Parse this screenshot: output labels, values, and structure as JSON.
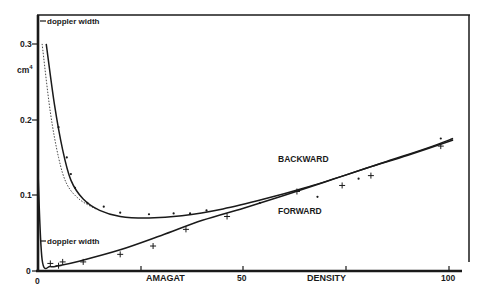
{
  "chart_data": {
    "type": "line",
    "title": "",
    "xlabel": "AMAGAT   DENSITY",
    "ylabel": "cm^4",
    "xlim": [
      0,
      103
    ],
    "ylim": [
      0,
      0.33
    ],
    "grid": false,
    "legend_position": "inline labels",
    "x_ticks": [
      0,
      25,
      50,
      75,
      100
    ],
    "x_tick_labels": [
      "0",
      "",
      "50",
      "",
      "100"
    ],
    "y_ticks": [
      0,
      0.1,
      0.2,
      0.3
    ],
    "y_tick_labels": [
      "0",
      "0.1",
      "0.2",
      "0.3"
    ],
    "annotations": [
      {
        "text": "doppler width",
        "x": 0,
        "y": 0.33,
        "arrow": "left"
      },
      {
        "text": "doppler width",
        "x": 0,
        "y": 0.04,
        "arrow": "left"
      }
    ],
    "series": [
      {
        "name": "BACKWARD",
        "style": "solid curve, dot markers",
        "curve": [
          [
            2,
            0.3
          ],
          [
            4,
            0.22
          ],
          [
            6,
            0.16
          ],
          [
            8,
            0.12
          ],
          [
            11,
            0.095
          ],
          [
            15,
            0.08
          ],
          [
            20,
            0.072
          ],
          [
            27,
            0.07
          ],
          [
            35,
            0.073
          ],
          [
            45,
            0.082
          ],
          [
            55,
            0.095
          ],
          [
            65,
            0.11
          ],
          [
            75,
            0.127
          ],
          [
            85,
            0.145
          ],
          [
            95,
            0.163
          ],
          [
            101,
            0.175
          ]
        ],
        "points": [
          [
            5,
            0.19
          ],
          [
            7,
            0.15
          ],
          [
            8,
            0.128
          ],
          [
            9,
            0.11
          ],
          [
            12,
            0.09
          ],
          [
            16,
            0.085
          ],
          [
            20,
            0.077
          ],
          [
            27,
            0.075
          ],
          [
            33,
            0.076
          ],
          [
            37,
            0.076
          ],
          [
            41,
            0.08
          ],
          [
            54,
            0.09
          ],
          [
            68,
            0.098
          ],
          [
            78,
            0.122
          ],
          [
            98,
            0.175
          ]
        ]
      },
      {
        "name": "BACKWARD (lower envelope)",
        "style": "thin dotted curve",
        "curve": [
          [
            1,
            0.3
          ],
          [
            3,
            0.21
          ],
          [
            5,
            0.15
          ],
          [
            7,
            0.115
          ],
          [
            10,
            0.095
          ],
          [
            14,
            0.082
          ]
        ]
      },
      {
        "name": "FORWARD",
        "style": "solid curve, cross markers",
        "curve": [
          [
            0,
            0.13
          ],
          [
            1,
            0.015
          ],
          [
            3,
            0.006
          ],
          [
            5,
            0.007
          ],
          [
            10,
            0.013
          ],
          [
            20,
            0.028
          ],
          [
            30,
            0.047
          ],
          [
            40,
            0.067
          ],
          [
            50,
            0.083
          ],
          [
            60,
            0.1
          ],
          [
            70,
            0.118
          ],
          [
            80,
            0.136
          ],
          [
            90,
            0.153
          ],
          [
            101,
            0.173
          ]
        ],
        "points": [
          [
            3,
            0.01
          ],
          [
            5,
            0.007
          ],
          [
            6,
            0.012
          ],
          [
            11,
            0.012
          ],
          [
            20,
            0.022
          ],
          [
            28,
            0.033
          ],
          [
            36,
            0.055
          ],
          [
            46,
            0.072
          ],
          [
            63,
            0.105
          ],
          [
            74,
            0.113
          ],
          [
            81,
            0.126
          ],
          [
            98,
            0.165
          ]
        ]
      }
    ]
  },
  "labels": {
    "y_unit": "cm",
    "y_unit_sup": "4",
    "x_axis_left": "AMAGAT",
    "x_axis_right": "DENSITY",
    "doppler_top": "doppler width",
    "doppler_bottom": "doppler width",
    "backward": "BACKWARD",
    "forward": "FORWARD",
    "tick_x0": "0",
    "tick_x50": "50",
    "tick_x100": "100",
    "tick_y0": "0",
    "tick_y1": "0.1",
    "tick_y2": "0.2",
    "tick_y3": "0.3"
  }
}
